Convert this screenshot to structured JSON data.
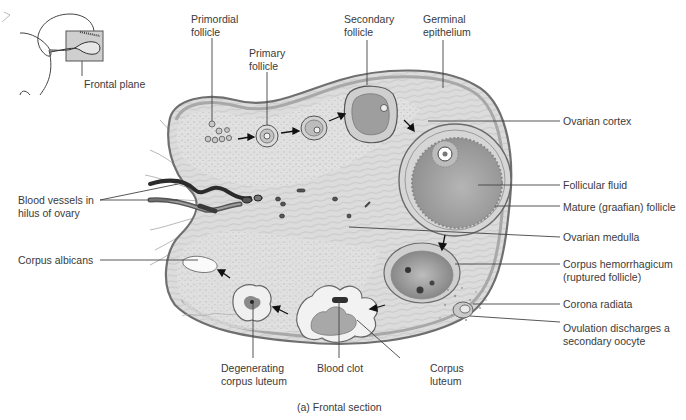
{
  "inset": {
    "label": "Frontal plane"
  },
  "labels": {
    "primordial_follicle": [
      "Primordial",
      "follicle"
    ],
    "primary_follicle": [
      "Primary",
      "follicle"
    ],
    "secondary_follicle": [
      "Secondary",
      "follicle"
    ],
    "germinal_epithelium": [
      "Germinal",
      "epithelium"
    ],
    "ovarian_cortex": "Ovarian cortex",
    "follicular_fluid": "Follicular fluid",
    "mature_follicle": "Mature (graafian) follicle",
    "ovarian_medulla": "Ovarian medulla",
    "corpus_hemorrhagicum": [
      "Corpus hemorrhagicum",
      "(ruptured follicle)"
    ],
    "corona_radiata": "Corona radiata",
    "ovulation": [
      "Ovulation discharges a",
      "secondary oocyte"
    ],
    "blood_vessels": [
      "Blood vessels in",
      "hilus of ovary"
    ],
    "corpus_albicans": "Corpus albicans",
    "degenerating_corpus_luteum": [
      "Degenerating",
      "corpus luteum"
    ],
    "blood_clot": "Blood clot",
    "corpus_luteum": [
      "Corpus",
      "luteum"
    ]
  },
  "caption": "(a) Frontal section",
  "colors": {
    "text": "#3a3a3a",
    "tissue_light": "#d9d9d9",
    "tissue_mid": "#bdbdbd",
    "tissue_dark": "#8a8a8a",
    "vessel": "#2b2b2b",
    "leader": "#444444"
  }
}
